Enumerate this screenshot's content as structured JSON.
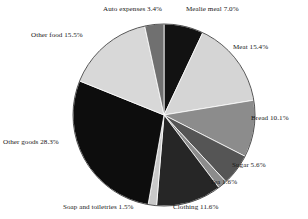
{
  "chart_data": {
    "type": "pie",
    "title": "",
    "subtitle": "",
    "xlabel": "",
    "ylabel": "",
    "legend_position": "none",
    "grid": false,
    "units": "percent",
    "total": "100.0%",
    "start_angle_deg": 0,
    "direction": "clockwise",
    "categories": [
      "Mealie meal",
      "Meat",
      "Bread",
      "Sugar",
      "Tea",
      "Clothing",
      "Soap and toiletries",
      "Other goods",
      "Other food",
      "Auto expenses"
    ],
    "values": [
      7.0,
      15.4,
      10.1,
      5.6,
      1.6,
      11.6,
      1.5,
      28.3,
      15.5,
      3.4
    ],
    "colors": [
      "#121212",
      "#d5d5d5",
      "#8c8c8c",
      "#555555",
      "#8c8c8c",
      "#262626",
      "#c9c9c9",
      "#0d0d0d",
      "#d8d8d8",
      "#707070"
    ],
    "slices": [
      {
        "label": "Mealie meal",
        "value": 7.0,
        "display": "Mealie meal 7.0%",
        "color": "#121212"
      },
      {
        "label": "Meat",
        "value": 15.4,
        "display": "Meat 15.4%",
        "color": "#d5d5d5"
      },
      {
        "label": "Bread",
        "value": 10.1,
        "display": "Bread 10.1%",
        "color": "#8c8c8c"
      },
      {
        "label": "Sugar",
        "value": 5.6,
        "display": "Sugar 5.6%",
        "color": "#555555"
      },
      {
        "label": "Tea",
        "value": 1.6,
        "display": "Tea 1.6%",
        "color": "#8c8c8c"
      },
      {
        "label": "Clothing",
        "value": 11.6,
        "display": "Clothing 11.6%",
        "color": "#262626"
      },
      {
        "label": "Soap and toiletries",
        "value": 1.5,
        "display": "Soap and toiletries 1.5%",
        "color": "#c9c9c9"
      },
      {
        "label": "Other goods",
        "value": 28.3,
        "display": "Other goods 28.3%",
        "color": "#0d0d0d"
      },
      {
        "label": "Other food",
        "value": 15.5,
        "display": "Other food 15.5%",
        "color": "#d8d8d8"
      },
      {
        "label": "Auto expenses",
        "value": 3.4,
        "display": "Auto expenses 3.4%",
        "color": "#707070"
      }
    ]
  },
  "labels": {
    "mealie_meal": "Mealie meal 7.0%",
    "meat": "Meat 15.4%",
    "bread": "Bread 10.1%",
    "sugar": "Sugar 5.6%",
    "tea": "Tea 1.6%",
    "clothing": "Clothing 11.6%",
    "soap_and_toiletries": "Soap and toiletries 1.5%",
    "other_goods": "Other goods 28.3%",
    "other_food": "Other food 15.5%",
    "auto_expenses": "Auto expenses 3.4%"
  }
}
